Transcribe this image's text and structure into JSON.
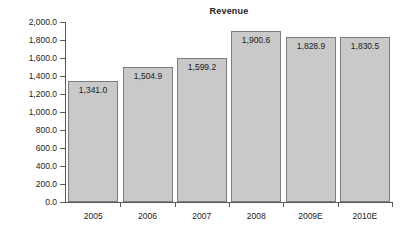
{
  "chart_data": {
    "type": "bar",
    "title": "Revenue",
    "xlabel": "",
    "ylabel": "",
    "categories": [
      "2005",
      "2006",
      "2007",
      "2008",
      "2009E",
      "2010E"
    ],
    "values": [
      1341.0,
      1504.9,
      1599.2,
      1900.6,
      1828.9,
      1830.5
    ],
    "value_labels": [
      "1,341.0",
      "1,504.9",
      "1,599.2",
      "1,900.6",
      "1,828.9",
      "1,830.5"
    ],
    "ylim": [
      0,
      2000
    ],
    "ytick_values": [
      0,
      200,
      400,
      600,
      800,
      1000,
      1200,
      1400,
      1600,
      1800,
      2000
    ],
    "ytick_labels": [
      "0.0",
      "200.0",
      "400.0",
      "600.0",
      "800.0",
      "1,000.0",
      "1,200.0",
      "1,400.0",
      "1,600.0",
      "1,800.0",
      "2,000.0"
    ],
    "grid": false,
    "legend": false,
    "colors": {
      "bar_fill": "#c9c9c9",
      "bar_border": "#7d7d7d",
      "axis": "#5a5a5a",
      "text": "#1c1c1c",
      "background": "#ffffff"
    }
  }
}
